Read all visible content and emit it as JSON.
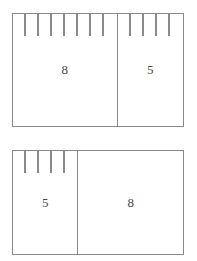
{
  "diagram": {
    "type": "bar-model-pair",
    "stroke_color": "#8a8a8a",
    "label_color": "#4a4a4a",
    "background_color": "#ffffff",
    "bars": [
      {
        "name": "top",
        "segments": [
          {
            "label": "8",
            "units": 8
          },
          {
            "label": "5",
            "units": 5
          }
        ]
      },
      {
        "name": "bottom",
        "segments": [
          {
            "label": "5",
            "units": 5
          },
          {
            "label": "8",
            "units": 8
          }
        ]
      }
    ]
  },
  "chart_data": {
    "type": "bar",
    "categories": [
      "8 + 5",
      "5 + 8"
    ],
    "series": [
      {
        "name": "first addend",
        "values": [
          8,
          5
        ]
      },
      {
        "name": "second addend",
        "values": [
          5,
          8
        ]
      }
    ],
    "total": 13,
    "xlabel": "",
    "ylabel": "",
    "grid": false,
    "legend": "none"
  }
}
